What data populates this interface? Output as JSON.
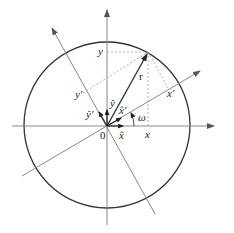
{
  "diagram": {
    "colors": {
      "background": "#ffffff",
      "circle": "#333333",
      "axes": "#888888",
      "vector": "#333333",
      "dashed": "#999999",
      "text": "#222222"
    },
    "origin_label": "0",
    "axes": {
      "x_label": "x",
      "y_label": "y",
      "x_prime_label": "x'",
      "y_prime_label": "y'"
    },
    "unit_vectors": {
      "x_hat": "x̂",
      "y_hat": "ŷ",
      "x_hat_prime": "x̂'",
      "y_hat_prime": "ŷ'"
    },
    "vector_label": "r",
    "angle_label": "ω"
  }
}
